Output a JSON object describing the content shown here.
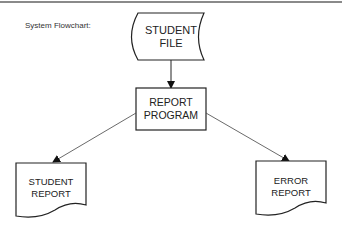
{
  "diagram": {
    "caption": "System Flowchart:",
    "nodes": [
      {
        "id": "student_file",
        "type": "stored-data",
        "line1": "STUDENT",
        "line2": "FILE"
      },
      {
        "id": "report_program",
        "type": "process",
        "line1": "REPORT",
        "line2": "PROGRAM"
      },
      {
        "id": "student_report",
        "type": "document",
        "line1": "STUDENT",
        "line2": "REPORT"
      },
      {
        "id": "error_report",
        "type": "document",
        "line1": "ERROR",
        "line2": "REPORT"
      }
    ],
    "edges": [
      {
        "from": "student_file",
        "to": "report_program"
      },
      {
        "from": "report_program",
        "to": "student_report"
      },
      {
        "from": "report_program",
        "to": "error_report"
      }
    ]
  }
}
